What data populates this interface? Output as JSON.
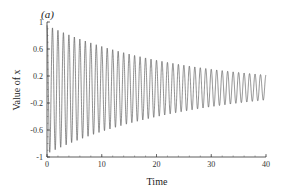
{
  "chart_data": {
    "type": "line",
    "title": "",
    "panel_label": "(a)",
    "xlabel": "Time",
    "ylabel": "Value of x",
    "xlim": [
      0,
      40
    ],
    "ylim": [
      -1,
      1
    ],
    "xticks": [
      0,
      10,
      20,
      30,
      40
    ],
    "yticks": [
      1,
      0.6,
      0.2,
      -0.2,
      -0.6,
      -1
    ],
    "xtick_labels": [
      "0",
      "10",
      "20",
      "30",
      "40"
    ],
    "ytick_labels": [
      "1",
      "0.6",
      "0.2",
      "-0.2",
      "-0.6",
      "-1"
    ],
    "grid": false,
    "legend": null,
    "series": [
      {
        "name": "x(t)",
        "description": "Damped oscillation, ~1 cycle per time unit, amplitude decaying from ~0.95 at t=0 to ~0.18 at t=40",
        "model": {
          "amplitude0": 0.95,
          "decay_rate": 0.041,
          "frequency": 1.0,
          "offset_end": 0.03
        },
        "envelope_samples": {
          "t": [
            0,
            5,
            10,
            15,
            20,
            25,
            30,
            35,
            40
          ],
          "upper": [
            0.95,
            0.78,
            0.64,
            0.52,
            0.42,
            0.35,
            0.29,
            0.24,
            0.21
          ],
          "lower": [
            -0.95,
            -0.76,
            -0.62,
            -0.48,
            -0.38,
            -0.29,
            -0.22,
            -0.17,
            -0.14
          ]
        },
        "color": "#444444"
      }
    ]
  }
}
